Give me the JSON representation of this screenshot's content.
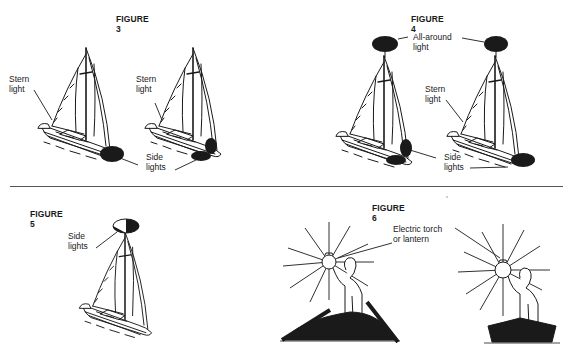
{
  "figures": [
    {
      "id": "figure-3",
      "title": "FIGURE 3",
      "labels": {
        "stern_light_left": "Stern\nlight",
        "stern_light_right": "Stern\nlight",
        "side_lights": "Side\nlights"
      }
    },
    {
      "id": "figure-4",
      "title": "FIGURE 4",
      "labels": {
        "all_around_light": "All-around\nlight",
        "stern_light": "Stern\nlight",
        "side_lights": "Side\nlights"
      }
    },
    {
      "id": "figure-5",
      "title": "FIGURE 5",
      "labels": {
        "side_lights": "Side\nlights"
      }
    },
    {
      "id": "figure-6",
      "title": "FIGURE 6",
      "labels": {
        "electric_torch": "Electric torch\nor lantern"
      }
    }
  ],
  "colors": {
    "ink": "#1a1a1a",
    "paper": "#ffffff",
    "divider": "#555555"
  }
}
